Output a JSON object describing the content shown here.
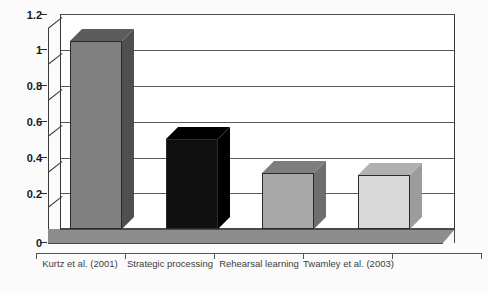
{
  "figure": {
    "title_remnant": "",
    "background_color": "#fbfbfb",
    "plot_background_color": "#ffffff",
    "axis_color": "#4a4a4a",
    "gridline_color": "#595959",
    "floor_color": "#8d8d8d"
  },
  "axes": {
    "y_ticks": [
      "0",
      "0.2",
      "0.4",
      "0.6",
      "0.8",
      "1",
      "1.2"
    ],
    "y_min": 0,
    "y_max": 1.2,
    "y_step": 0.2,
    "x_labels": [
      "Kurtz et al. (2001)",
      "Strategic\nprocessing",
      "Rehearsal\nlearning",
      "Twamley et al. (2003)"
    ]
  },
  "chart_data": {
    "type": "bar",
    "title": "",
    "xlabel": "",
    "ylabel": "",
    "ylim": [
      0,
      1.2
    ],
    "yticks": [
      0,
      0.2,
      0.4,
      0.6,
      0.8,
      1.0,
      1.2
    ],
    "grid": true,
    "legend": false,
    "three_d": true,
    "categories": [
      "Kurtz et al. (2001)",
      "Strategic processing",
      "Rehearsal learning",
      "Twamley et al. (2003)"
    ],
    "values": [
      1.05,
      0.5,
      0.31,
      0.3
    ],
    "bar_colors": [
      "#808080",
      "#101010",
      "#a8a8a8",
      "#d9d9d9"
    ],
    "bar_top_colors": [
      "#5c5c5c",
      "#000000",
      "#7e7e7e",
      "#b0b0b0"
    ],
    "bar_side_colors": [
      "#4f4f4f",
      "#000000",
      "#6e6e6e",
      "#9c9c9c"
    ],
    "series": [
      {
        "name": "Effect size",
        "values": [
          1.05,
          0.5,
          0.31,
          0.3
        ]
      }
    ]
  },
  "bars": [
    {
      "label": "Kurtz et al. (2001)",
      "value": 1.05,
      "color": "#808080",
      "top_color": "#5c5c5c",
      "side_color": "#4f4f4f"
    },
    {
      "label": "Strategic processing",
      "value": 0.5,
      "color": "#101010",
      "top_color": "#000000",
      "side_color": "#000000"
    },
    {
      "label": "Rehearsal learning",
      "value": 0.31,
      "color": "#a8a8a8",
      "top_color": "#7e7e7e",
      "side_color": "#6e6e6e"
    },
    {
      "label": "Twamley et al. (2003)",
      "value": 0.3,
      "color": "#d9d9d9",
      "top_color": "#b0b0b0",
      "side_color": "#9c9c9c"
    }
  ]
}
